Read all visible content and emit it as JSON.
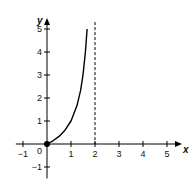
{
  "chart_data": {
    "type": "line",
    "title": "",
    "xlabel": "x",
    "ylabel": "y",
    "xlim": [
      -1.3,
      5.5
    ],
    "ylim": [
      -1.5,
      5.3
    ],
    "x_ticks": [
      -1,
      1,
      2,
      3,
      4,
      5
    ],
    "y_ticks": [
      -1,
      1,
      2,
      3,
      4,
      5
    ],
    "x_tick_labels": [
      "−1",
      "1",
      "2",
      "3",
      "4",
      "5"
    ],
    "y_tick_labels": [
      "−1",
      "1",
      "2",
      "3",
      "4",
      "5"
    ],
    "origin_label": "0",
    "grid": false,
    "series": [
      {
        "name": "curve",
        "x": [
          0,
          0.25,
          0.5,
          0.75,
          1.0,
          1.25,
          1.4,
          1.5,
          1.6,
          1.67
        ],
        "y": [
          0,
          0.14,
          0.33,
          0.6,
          1.0,
          1.67,
          2.33,
          3.0,
          4.0,
          5.0
        ],
        "color": "#000000"
      }
    ],
    "annotations": [
      {
        "type": "vertical_asymptote",
        "x": 2,
        "style": "dashed"
      },
      {
        "type": "point",
        "x": 0,
        "y": 0,
        "style": "filled",
        "label": "closed endpoint at origin"
      }
    ]
  }
}
